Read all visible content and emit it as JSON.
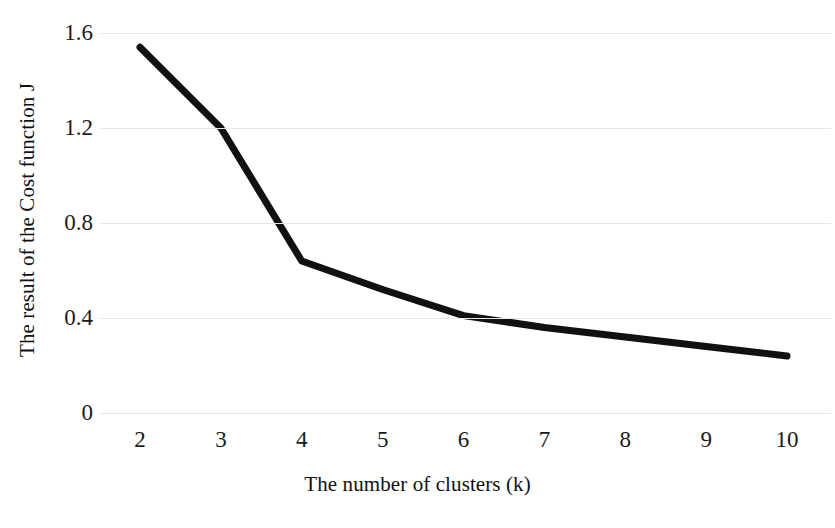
{
  "chart_data": {
    "type": "line",
    "title": "",
    "subtitle": "",
    "xlabel": "The number of clusters (k)",
    "ylabel": "The result of the Cost function J",
    "x": [
      2,
      3,
      4,
      5,
      6,
      7,
      8,
      9,
      10
    ],
    "values": [
      1.54,
      1.2,
      0.64,
      0.52,
      0.41,
      0.36,
      0.32,
      0.28,
      0.24
    ],
    "series": [
      {
        "name": "Cost function J",
        "values": [
          1.54,
          1.2,
          0.64,
          0.52,
          0.41,
          0.36,
          0.32,
          0.28,
          0.24
        ]
      }
    ],
    "x_tick_labels": [
      "2",
      "3",
      "4",
      "5",
      "6",
      "7",
      "8",
      "9",
      "10"
    ],
    "y_tick_labels": [
      "1.6",
      "1.2",
      "0.8",
      "0.4",
      "0"
    ],
    "y_tick_values": [
      1.6,
      1.2,
      0.8,
      0.4,
      0
    ],
    "xlim": [
      2,
      10
    ],
    "ylim": [
      0,
      1.6
    ],
    "grid": "horizontal",
    "legend": "none",
    "annotations": [],
    "line_color": "#111111",
    "line_width": 7,
    "grid_color": "#e4e6e8",
    "background_color": "#ffffff",
    "text_color": "#111111"
  }
}
